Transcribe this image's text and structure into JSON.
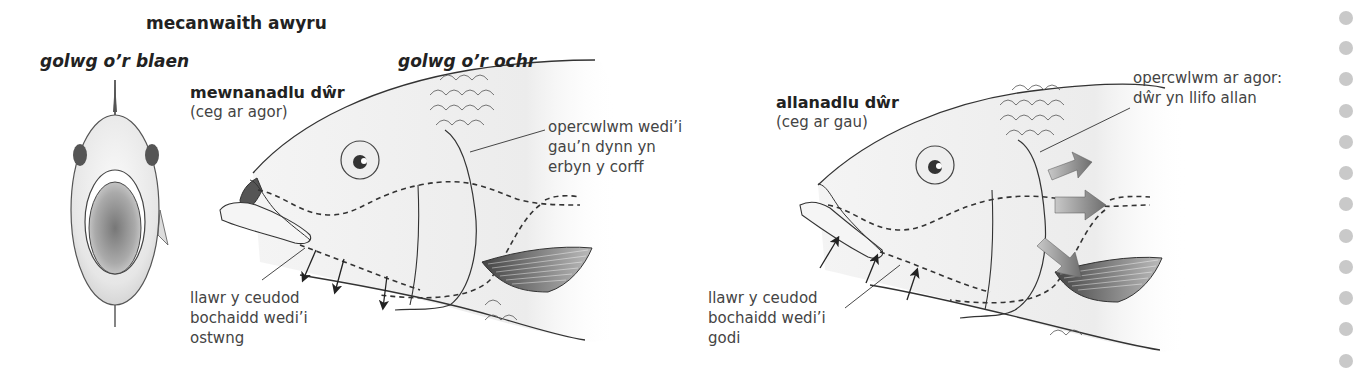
{
  "title": "mecanwaith awyru",
  "front_view": {
    "label": "golwg o’r blaen"
  },
  "side_view": {
    "label": "golwg o’r ochr"
  },
  "inhale": {
    "heading": "mewnanadlu dŵr",
    "subheading": "(ceg ar agor)",
    "operculum_label": "opercwlwm wedi’i\ngau’n dynn yn\nerbyn y corff",
    "floor_label": "llawr y ceudod\nbochaidd wedi’i\nostwng"
  },
  "exhale": {
    "heading": "allanadlu dŵr",
    "subheading": "(ceg ar gau)",
    "operculum_label": "opercwlwm ar agor:\ndŵr yn llifo allan",
    "floor_label": "llawr y ceudod\nbochaidd wedi’i\ngodi"
  },
  "colors": {
    "outline": "#333333",
    "fish_fill": "#f2f2f2",
    "fish_shade": "#d8d8d8",
    "arrow_fill": "#8a8a8a",
    "side_dots": "#c9c9c9"
  },
  "side_dots_count": 12
}
